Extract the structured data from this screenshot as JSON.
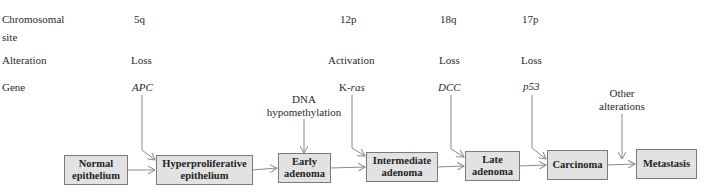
{
  "row_headers": {
    "chromosomal_site_line1": "Chromosomal",
    "chromosomal_site_line2": "site",
    "alteration": "Alteration",
    "gene": "Gene"
  },
  "columns": [
    {
      "site": "5q",
      "alteration": "Loss",
      "gene": "APC",
      "gene_prefix": "",
      "target_stage": "Hyperproliferative epithelium"
    },
    {
      "site": "12p",
      "alteration": "Activation",
      "gene": "ras",
      "gene_prefix": "K-",
      "target_stage": "Intermediate adenoma"
    },
    {
      "site": "18q",
      "alteration": "Loss",
      "gene": "DCC",
      "gene_prefix": "",
      "target_stage": "Late adenoma"
    },
    {
      "site": "17p",
      "alteration": "Loss",
      "gene": "p53",
      "gene_prefix": "",
      "target_stage": "Carcinoma"
    }
  ],
  "side_inputs": [
    {
      "line1": "DNA",
      "line2": "hypomethylation",
      "target_stage": "Early adenoma"
    },
    {
      "line1": "Other",
      "line2": "alterations",
      "target_stage": "Metastasis"
    }
  ],
  "stages": [
    {
      "line1": "Normal",
      "line2": "epithelium"
    },
    {
      "line1": "Hyperproliferative",
      "line2": "epithelium"
    },
    {
      "line1": "Early",
      "line2": "adenoma"
    },
    {
      "line1": "Intermediate",
      "line2": "adenoma"
    },
    {
      "line1": "Late",
      "line2": "adenoma"
    },
    {
      "line1": "Carcinoma",
      "line2": ""
    },
    {
      "line1": "Metastasis",
      "line2": ""
    }
  ],
  "colors": {
    "box_fill": "#e2e2e2",
    "box_border": "#7a7a7a",
    "arrow": "#8a8a8a",
    "text": "#2a2a2a"
  }
}
